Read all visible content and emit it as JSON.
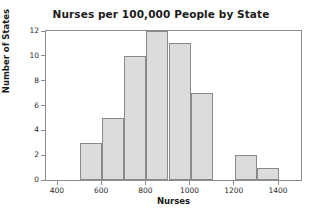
{
  "chart_data": {
    "type": "bar",
    "subtype": "histogram",
    "title": "Nurses per 100,000 People by State",
    "xlabel": "Nurses",
    "ylabel": "Number of States",
    "xlim": [
      400,
      1400
    ],
    "ylim": [
      0,
      12
    ],
    "bin_width": 100,
    "grid": false,
    "legend": null,
    "x_ticks": [
      400,
      600,
      800,
      1000,
      1200,
      1400
    ],
    "x_tick_labels": [
      "400",
      "600",
      "800",
      "1000",
      "1200",
      "1400"
    ],
    "y_ticks": [
      0,
      2,
      4,
      6,
      8,
      10,
      12
    ],
    "y_tick_labels": [
      "0",
      "2",
      "4",
      "6",
      "8",
      "10",
      "12"
    ],
    "bin_edges": [
      400,
      500,
      600,
      700,
      800,
      900,
      1000,
      1100,
      1200,
      1300,
      1400
    ],
    "categories": [
      "400-500",
      "500-600",
      "600-700",
      "700-800",
      "800-900",
      "900-1000",
      "1000-1100",
      "1100-1200",
      "1200-1300",
      "1300-1400"
    ],
    "values": [
      0,
      3,
      5,
      10,
      12,
      11,
      7,
      0,
      2,
      1
    ],
    "bars": [
      {
        "label": "400-500",
        "x0": 400,
        "x1": 500,
        "value": 0
      },
      {
        "label": "500-600",
        "x0": 500,
        "x1": 600,
        "value": 3
      },
      {
        "label": "600-700",
        "x0": 600,
        "x1": 700,
        "value": 5
      },
      {
        "label": "700-800",
        "x0": 700,
        "x1": 800,
        "value": 10
      },
      {
        "label": "800-900",
        "x0": 800,
        "x1": 900,
        "value": 12
      },
      {
        "label": "900-1000",
        "x0": 900,
        "x1": 1000,
        "value": 11
      },
      {
        "label": "1000-1100",
        "x0": 1000,
        "x1": 1100,
        "value": 7
      },
      {
        "label": "1100-1200",
        "x0": 1100,
        "x1": 1200,
        "value": 0
      },
      {
        "label": "1200-1300",
        "x0": 1200,
        "x1": 1300,
        "value": 2
      },
      {
        "label": "1300-1400",
        "x0": 1300,
        "x1": 1400,
        "value": 1
      }
    ],
    "colors": {
      "bar_fill": "#dcdcdc",
      "bar_border": "#8a8a8a",
      "axis": "#8c8c8c",
      "text": "#1b1b1b",
      "tick_text": "#2a2a2a",
      "background": "#ffffff"
    }
  }
}
